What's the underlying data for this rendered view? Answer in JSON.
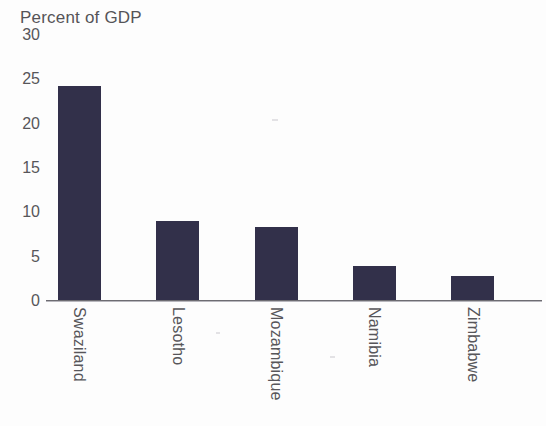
{
  "chart_data": {
    "type": "bar",
    "title": "Percent of GDP",
    "xlabel": "",
    "ylabel": "Percent of GDP",
    "categories": [
      "Swaziland",
      "Lesotho",
      "Mozambique",
      "Namibia",
      "Zimbabwe"
    ],
    "values": [
      24.2,
      9.0,
      8.3,
      4.0,
      2.8
    ],
    "ylim": [
      0,
      30
    ],
    "yticks": [
      0,
      5,
      10,
      15,
      20,
      25,
      30
    ],
    "ytick_labels": [
      "0",
      "5",
      "10",
      "15",
      "20",
      "25",
      "30"
    ],
    "grid": false,
    "legend": null,
    "bar_color": "#32304a",
    "axis_color": "#6d6c72",
    "text_color": "#57565a"
  },
  "figure": {
    "title": "Percent of GDP",
    "top_tick": "30"
  }
}
